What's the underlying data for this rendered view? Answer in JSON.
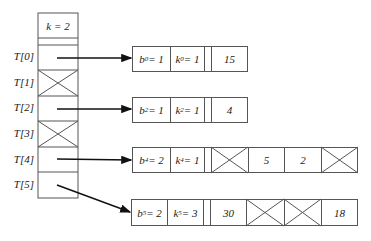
{
  "header": {
    "k": "k = 2"
  },
  "table_labels": [
    "T[0]",
    "T[1]",
    "T[2]",
    "T[3]",
    "T[4]",
    "T[5]"
  ],
  "table_slots": [
    {
      "index": 0,
      "state": "pointer"
    },
    {
      "index": 1,
      "state": "empty"
    },
    {
      "index": 2,
      "state": "pointer"
    },
    {
      "index": 3,
      "state": "empty"
    },
    {
      "index": 4,
      "state": "pointer"
    },
    {
      "index": 5,
      "state": "pointer"
    }
  ],
  "buckets": [
    {
      "slot": 0,
      "b_label": "b",
      "b_sub": "0",
      "b_val": " = 1",
      "k_label": "k",
      "k_sub": "0",
      "k_val": " = 1",
      "values": [
        "15"
      ]
    },
    {
      "slot": 2,
      "b_label": "b",
      "b_sub": "2",
      "b_val": " = 1",
      "k_label": "k",
      "k_sub": "2",
      "k_val": " = 1",
      "values": [
        "4"
      ]
    },
    {
      "slot": 4,
      "b_label": "b",
      "b_sub": "4",
      "b_val": " = 2",
      "k_label": "k",
      "k_sub": "4",
      "k_val": " = 1",
      "values": [
        null,
        "5",
        "2",
        null
      ]
    },
    {
      "slot": 5,
      "b_label": "b",
      "b_sub": "5",
      "b_val": " = 2",
      "k_label": "k",
      "k_sub": "5",
      "k_val": " = 3",
      "values": [
        "30",
        null,
        null,
        "18"
      ]
    }
  ]
}
